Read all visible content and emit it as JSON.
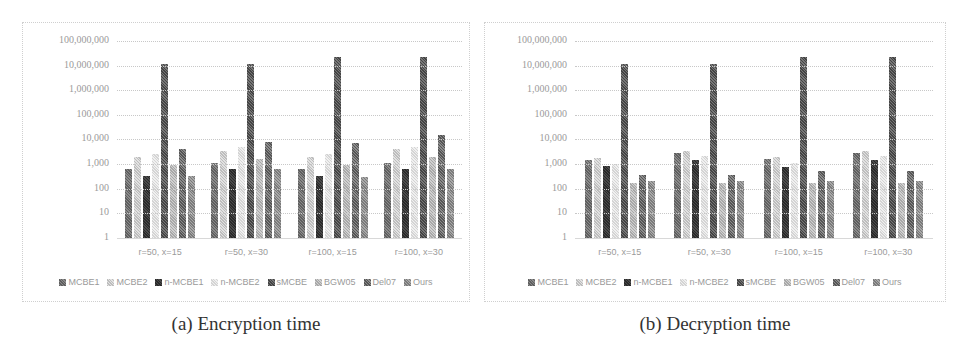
{
  "chart_data": [
    {
      "type": "bar",
      "title": "",
      "caption": "(a) Encryption time",
      "xlabel": "",
      "ylabel": "",
      "yscale": "log",
      "ylim": [
        1,
        100000000
      ],
      "yticks": [
        "1",
        "10",
        "100",
        "1,000",
        "10,000",
        "100,000",
        "1,000,000",
        "10,000,000",
        "100,000,000"
      ],
      "grid": true,
      "legend_position": "bottom",
      "categories": [
        "r=50, x=15",
        "r=50, x=30",
        "r=100, x=15",
        "r=100, x=30"
      ],
      "series": [
        {
          "name": "MCBE1",
          "values": [
            600,
            1100,
            600,
            1150
          ]
        },
        {
          "name": "MCBE2",
          "values": [
            2000,
            3500,
            2000,
            4000
          ]
        },
        {
          "name": "n-MCBE1",
          "values": [
            330,
            620,
            320,
            620
          ]
        },
        {
          "name": "n-MCBE2",
          "values": [
            2500,
            5000,
            2500,
            5000
          ]
        },
        {
          "name": "sMCBE",
          "values": [
            12000000,
            12000000,
            22000000,
            22000000
          ]
        },
        {
          "name": "BGW05",
          "values": [
            900,
            1600,
            950,
            1900
          ]
        },
        {
          "name": "Del07",
          "values": [
            4000,
            8000,
            7000,
            15000
          ]
        },
        {
          "name": "Ours",
          "values": [
            330,
            620,
            310,
            600
          ]
        }
      ]
    },
    {
      "type": "bar",
      "title": "",
      "caption": "(b) Decryption time",
      "xlabel": "",
      "ylabel": "",
      "yscale": "log",
      "ylim": [
        1,
        100000000
      ],
      "yticks": [
        "1",
        "10",
        "100",
        "1,000",
        "10,000",
        "100,000",
        "1,000,000",
        "10,000,000",
        "100,000,000"
      ],
      "grid": true,
      "legend_position": "bottom",
      "categories": [
        "r=50, x=15",
        "r=50, x=30",
        "r=100, x=15",
        "r=100, x=30"
      ],
      "series": [
        {
          "name": "MCBE1",
          "values": [
            1500,
            2800,
            1600,
            2800
          ]
        },
        {
          "name": "MCBE2",
          "values": [
            1800,
            3500,
            1900,
            3500
          ]
        },
        {
          "name": "n-MCBE1",
          "values": [
            800,
            1400,
            750,
            1400
          ]
        },
        {
          "name": "n-MCBE2",
          "values": [
            1000,
            2200,
            1100,
            2200
          ]
        },
        {
          "name": "sMCBE",
          "values": [
            12000000,
            12000000,
            22000000,
            22000000
          ]
        },
        {
          "name": "BGW05",
          "values": [
            170,
            170,
            170,
            170
          ]
        },
        {
          "name": "Del07",
          "values": [
            350,
            350,
            500,
            500
          ]
        },
        {
          "name": "Ours",
          "values": [
            200,
            200,
            200,
            200
          ]
        }
      ]
    }
  ]
}
